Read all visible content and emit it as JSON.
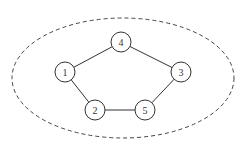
{
  "diagram": {
    "type": "graph",
    "boundary": {
      "shape": "ellipse",
      "style": "dashed",
      "cx": 123,
      "cy": 78,
      "rx": 111,
      "ry": 60
    },
    "nodes": [
      {
        "id": "1",
        "label": "1",
        "x": 65,
        "y": 72
      },
      {
        "id": "2",
        "label": "2",
        "x": 95,
        "y": 110
      },
      {
        "id": "3",
        "label": "3",
        "x": 181,
        "y": 72
      },
      {
        "id": "4",
        "label": "4",
        "x": 121,
        "y": 42
      },
      {
        "id": "5",
        "label": "5",
        "x": 145,
        "y": 110
      }
    ],
    "edges": [
      {
        "from": "1",
        "to": "4"
      },
      {
        "from": "4",
        "to": "3"
      },
      {
        "from": "3",
        "to": "5"
      },
      {
        "from": "5",
        "to": "2"
      },
      {
        "from": "2",
        "to": "1"
      }
    ],
    "node_radius": 10,
    "colors": {
      "stroke": "#333333",
      "boundary": "#444444",
      "fill": "#ffffff"
    }
  }
}
